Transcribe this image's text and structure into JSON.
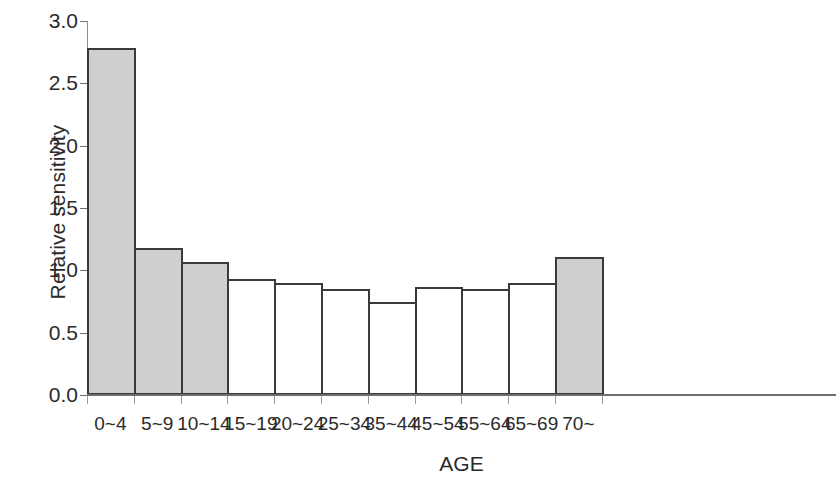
{
  "chart_data": {
    "type": "bar",
    "title": "",
    "xlabel": "AGE",
    "ylabel": "Relative sensitivity",
    "categories": [
      "0~4",
      "5~9",
      "10~14",
      "15~19",
      "20~24",
      "25~34",
      "35~44",
      "45~54",
      "55~64",
      "65~69",
      "70~"
    ],
    "values": [
      2.78,
      1.18,
      1.07,
      0.93,
      0.9,
      0.85,
      0.75,
      0.87,
      0.85,
      0.9,
      1.11
    ],
    "bar_fills": [
      "gray",
      "gray",
      "gray",
      "white",
      "white",
      "white",
      "white",
      "white",
      "white",
      "white",
      "gray"
    ],
    "ylim": [
      0.0,
      3.0
    ],
    "y_ticks": [
      "0.0",
      "0.5",
      "1.0",
      "1.5",
      "2.0",
      "2.5",
      "3.0"
    ],
    "y_tick_values": [
      0.0,
      0.5,
      1.0,
      1.5,
      2.0,
      2.5,
      3.0
    ],
    "grid": false,
    "legend": "none",
    "colors": {
      "bar_fill_gray": "#cfcfcf",
      "bar_fill_white": "#ffffff",
      "bar_border": "#3a3a3a",
      "axis": "#6f6f6f",
      "text": "#2b2b2b",
      "background": "#ffffff"
    }
  }
}
